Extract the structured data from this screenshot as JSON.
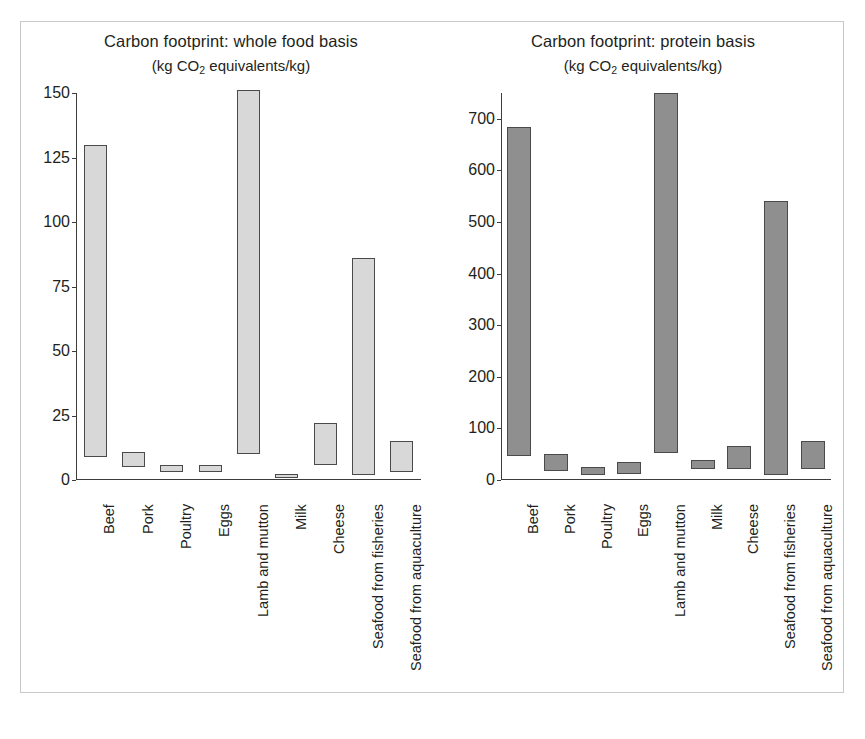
{
  "figure": {
    "background": "#ffffff",
    "frame_color": "#c9c9c9"
  },
  "charts": [
    {
      "id": "whole-food-basis",
      "title": "Carbon footprint: whole food basis",
      "subtitle_pre": "(kg CO",
      "subtitle_sub": "2",
      "subtitle_post": " equivalents/kg)",
      "bar_fill": "#d8d8d8",
      "bar_stroke": "#4a4a4a"
    },
    {
      "id": "protein-basis",
      "title": "Carbon footprint: protein basis",
      "subtitle_pre": "(kg CO",
      "subtitle_sub": "2",
      "subtitle_post": " equivalents/kg)",
      "bar_fill": "#8f8f8f",
      "bar_stroke": "#4a4a4a"
    }
  ],
  "chart_data": [
    {
      "type": "bar",
      "bar_style": "floating-range",
      "title": "Carbon footprint: whole food basis",
      "subtitle": "(kg CO2 equivalents/kg)",
      "xlabel": "",
      "ylabel": "kg CO2 equivalents/kg",
      "ylim": [
        0,
        150
      ],
      "yticks": [
        0,
        25,
        50,
        75,
        100,
        125,
        150
      ],
      "ytick_labels": [
        "0",
        "25",
        "50",
        "75",
        "100",
        "125",
        "150"
      ],
      "grid": false,
      "legend": "none",
      "categories": [
        "Beef",
        "Pork",
        "Poultry",
        "Eggs",
        "Lamb and mutton",
        "Milk",
        "Cheese",
        "Seafood from fisheries",
        "Seafood from aquaculture"
      ],
      "series": [
        {
          "name": "range low",
          "values": [
            9,
            5,
            3,
            3,
            10,
            1,
            6,
            2,
            3
          ]
        },
        {
          "name": "range high",
          "values": [
            130,
            11,
            6,
            6,
            151,
            2.5,
            22,
            86,
            15
          ]
        }
      ]
    },
    {
      "type": "bar",
      "bar_style": "floating-range",
      "title": "Carbon footprint: protein basis",
      "subtitle": "(kg CO2 equivalents/kg)",
      "xlabel": "",
      "ylabel": "kg CO2 equivalents/kg",
      "ylim": [
        0,
        750
      ],
      "yticks": [
        0,
        100,
        200,
        300,
        400,
        500,
        600,
        700
      ],
      "ytick_labels": [
        "0",
        "100",
        "200",
        "300",
        "400",
        "500",
        "600",
        "700"
      ],
      "grid": false,
      "legend": "none",
      "categories": [
        "Beef",
        "Pork",
        "Poultry",
        "Eggs",
        "Lamb and mutton",
        "Milk",
        "Cheese",
        "Seafood from fisheries",
        "Seafood from aquaculture"
      ],
      "series": [
        {
          "name": "range low",
          "values": [
            47,
            18,
            10,
            12,
            52,
            22,
            22,
            9,
            22
          ]
        },
        {
          "name": "range high",
          "values": [
            685,
            50,
            25,
            35,
            750,
            38,
            65,
            540,
            75
          ]
        }
      ]
    }
  ]
}
